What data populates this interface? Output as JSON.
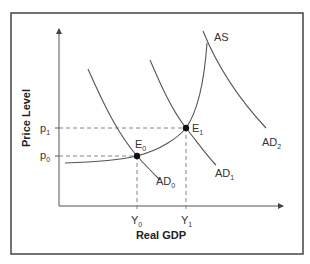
{
  "diagram": {
    "x_axis_label": "Real GDP",
    "y_axis_label": "Price Level",
    "curves": {
      "as": {
        "label": "AS",
        "sub": ""
      },
      "ad0": {
        "label": "AD",
        "sub": "0"
      },
      "ad1": {
        "label": "AD",
        "sub": "1"
      },
      "ad2": {
        "label": "AD",
        "sub": "2"
      }
    },
    "equilibria": {
      "e0": {
        "label": "E",
        "sub": "0"
      },
      "e1": {
        "label": "E",
        "sub": "1"
      }
    },
    "price_levels": {
      "p0": {
        "label": "p",
        "sub": "0"
      },
      "p1": {
        "label": "p",
        "sub": "1"
      }
    },
    "outputs": {
      "y0": {
        "label": "Y",
        "sub": "0"
      },
      "y1": {
        "label": "Y",
        "sub": "1"
      }
    },
    "colors": {
      "frame": "#444444",
      "curve": "#555555",
      "dash": "#777777",
      "point": "#111111"
    }
  }
}
